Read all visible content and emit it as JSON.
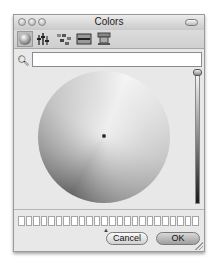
{
  "window": {
    "title": "Colors",
    "traffic_lights": [
      "close",
      "minimize",
      "zoom"
    ]
  },
  "toolbar": {
    "modes": [
      {
        "name": "color-wheel",
        "icon": "color-wheel-icon",
        "selected": true
      },
      {
        "name": "color-sliders",
        "icon": "sliders-icon",
        "selected": false
      },
      {
        "name": "color-palettes",
        "icon": "palettes-icon",
        "selected": false
      },
      {
        "name": "image-palettes",
        "icon": "image-palette-icon",
        "selected": false
      },
      {
        "name": "crayons",
        "icon": "crayons-icon",
        "selected": false
      }
    ]
  },
  "search": {
    "icon": "magnifier-icon",
    "value": "",
    "placeholder": ""
  },
  "swatch_count": 24,
  "buttons": {
    "cancel_label": "Cancel",
    "ok_label": "OK"
  }
}
